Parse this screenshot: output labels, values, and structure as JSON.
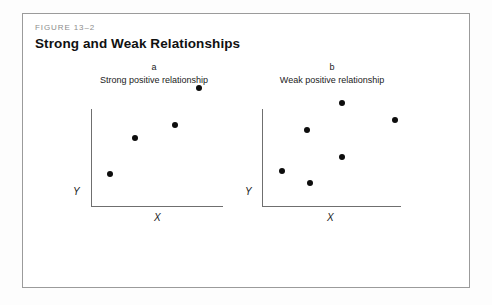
{
  "figure": {
    "number_label": "FIGURE 13–2",
    "title": "Strong and Weak Relationships",
    "frame_border_color": "#9b9b9b",
    "background_color": "#ffffff"
  },
  "chart_data": [
    {
      "type": "scatter",
      "panel_letter": "a",
      "title": "Strong positive relationship",
      "xlabel": "X",
      "ylabel": "Y",
      "xlim": [
        0,
        100
      ],
      "ylim": [
        0,
        100
      ],
      "grid": false,
      "legend": "none",
      "marker_color": "#0d0d0d",
      "points": [
        {
          "x": 14,
          "y": 33
        },
        {
          "x": 33,
          "y": 70
        },
        {
          "x": 63,
          "y": 84
        },
        {
          "x": 82,
          "y": 122
        }
      ]
    },
    {
      "type": "scatter",
      "panel_letter": "b",
      "title": "Weak positive relationship",
      "xlabel": "X",
      "ylabel": "Y",
      "xlim": [
        0,
        100
      ],
      "ylim": [
        0,
        100
      ],
      "grid": false,
      "legend": "none",
      "marker_color": "#0d0d0d",
      "points": [
        {
          "x": 14,
          "y": 36
        },
        {
          "x": 32,
          "y": 78
        },
        {
          "x": 34,
          "y": 24
        },
        {
          "x": 57,
          "y": 106
        },
        {
          "x": 57,
          "y": 51
        },
        {
          "x": 96,
          "y": 89
        }
      ]
    }
  ]
}
